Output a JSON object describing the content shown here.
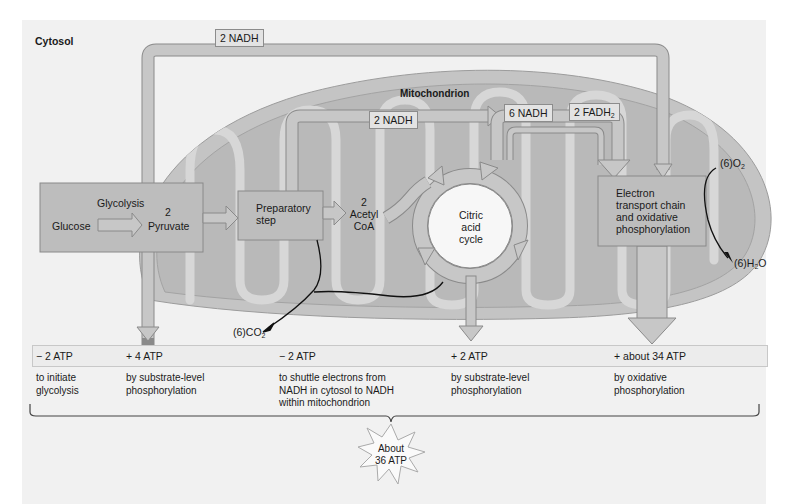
{
  "figure": {
    "regions": {
      "cytosol": "Cytosol",
      "mitochondrion": "Mitochondrion"
    },
    "carriers": {
      "cytosol_nadh": "2 NADH",
      "prep_nadh": "2 NADH",
      "cycle_nadh": "6 NADH",
      "cycle_fadh2_main": "2 FADH",
      "cycle_fadh2_sub": "2"
    },
    "stages": {
      "glycolysis": {
        "title": "Glycolysis",
        "input": "Glucose",
        "output_count": "2",
        "output": "Pyruvate"
      },
      "preparatory": {
        "line1": "Preparatory",
        "line2": "step"
      },
      "acetyl": {
        "count": "2",
        "line1": "Acetyl",
        "line2": "CoA"
      },
      "citric": {
        "line1": "Citric",
        "line2": "acid",
        "line3": "cycle"
      },
      "etc": {
        "line1": "Electron",
        "line2": "transport chain",
        "line3": "and oxidative",
        "line4": "phosphorylation"
      }
    },
    "molecules": {
      "o2_prefix": "(6)O",
      "o2_sub": "2",
      "h2o_prefix": "(6)H",
      "h2o_sub": "2",
      "h2o_suffix": "O",
      "co2_prefix": "(6)CO",
      "co2_sub": "2"
    },
    "atp_yields": [
      {
        "value": "− 2 ATP",
        "description": "to initiate\nglycolysis"
      },
      {
        "value": "+ 4 ATP",
        "description": "by substrate-level\nphosphorylation"
      },
      {
        "value": "− 2 ATP",
        "description": "to shuttle electrons from\nNADH in cytosol to NADH\nwithin mitochondrion"
      },
      {
        "value": "+ 2 ATP",
        "description": "by substrate-level\nphosphorylation"
      },
      {
        "value": "+ about 34 ATP",
        "description": "by oxidative\nphosphorylation"
      }
    ],
    "total": {
      "line1": "About",
      "line2": "36 ATP"
    },
    "colors": {
      "panel_bg": "#f1f1f1",
      "mito_outer": "#c4c4c4",
      "mito_inner": "#b8b8b8",
      "cristae": "#d6d6d6",
      "box_fill": "#bdbdbd",
      "arrow_fill": "#c7c7c7",
      "arrow_stroke": "#8a8a8a",
      "cycle_fill": "#f7f7f7"
    }
  }
}
